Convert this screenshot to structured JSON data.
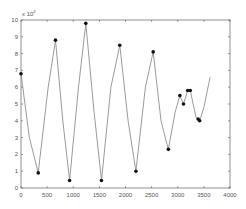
{
  "chart_data": {
    "type": "line",
    "title": "",
    "xlabel": "",
    "ylabel": "",
    "y_multiplier_label": "x 10^4",
    "xlim": [
      0,
      4000
    ],
    "ylim": [
      0,
      10
    ],
    "x_ticks": [
      0,
      500,
      1000,
      1500,
      2000,
      2500,
      3000,
      3500,
      4000
    ],
    "y_ticks": [
      0,
      1,
      2,
      3,
      4,
      5,
      6,
      7,
      8,
      9,
      10
    ],
    "grid": false,
    "legend": null,
    "series": [
      {
        "name": "signal",
        "color": "#808080",
        "line": [
          [
            0,
            6.8
          ],
          [
            160,
            3.0
          ],
          [
            330,
            0.9
          ],
          [
            520,
            6.0
          ],
          [
            660,
            8.8
          ],
          [
            800,
            4.0
          ],
          [
            930,
            0.45
          ],
          [
            1100,
            6.0
          ],
          [
            1240,
            9.8
          ],
          [
            1400,
            4.5
          ],
          [
            1540,
            0.45
          ],
          [
            1720,
            6.0
          ],
          [
            1890,
            8.5
          ],
          [
            2050,
            4.0
          ],
          [
            2200,
            1.0
          ],
          [
            2380,
            6.0
          ],
          [
            2530,
            8.1
          ],
          [
            2680,
            4.0
          ],
          [
            2820,
            2.3
          ],
          [
            2950,
            4.5
          ],
          [
            3040,
            5.5
          ],
          [
            3110,
            5.0
          ],
          [
            3190,
            5.8
          ],
          [
            3240,
            5.8
          ],
          [
            3350,
            4.2
          ],
          [
            3420,
            4.0
          ],
          [
            3500,
            4.8
          ],
          [
            3620,
            6.6
          ]
        ],
        "markers": [
          [
            0,
            6.8
          ],
          [
            330,
            0.9
          ],
          [
            660,
            8.8
          ],
          [
            930,
            0.45
          ],
          [
            1240,
            9.8
          ],
          [
            1540,
            0.45
          ],
          [
            1890,
            8.5
          ],
          [
            2200,
            1.0
          ],
          [
            2530,
            8.1
          ],
          [
            2820,
            2.3
          ],
          [
            3040,
            5.5
          ],
          [
            3110,
            5.0
          ],
          [
            3190,
            5.8
          ],
          [
            3240,
            5.8
          ],
          [
            3390,
            4.1
          ],
          [
            3420,
            4.0
          ]
        ]
      }
    ]
  }
}
